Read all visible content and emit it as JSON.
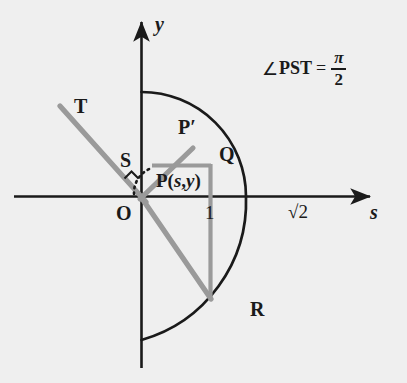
{
  "figure": {
    "kind": "geometry-diagram",
    "background_color": "#efefef",
    "ink_color": "#1a1a1a",
    "accent_color": "#9a9a9a",
    "annotation": {
      "angle_symbol": "∠",
      "angle_name": "PST",
      "equals": "=",
      "value_numerator": "π",
      "value_denominator": "2",
      "full_text": "∠PST = π/2"
    },
    "axes": {
      "y_axis_label": "y",
      "x_axis_label": "s",
      "origin_label": "O"
    },
    "ticks": [
      {
        "label": "1",
        "axis": "s",
        "value": 1
      },
      {
        "label": "√2",
        "axis": "s",
        "value": 1.414
      }
    ],
    "points": [
      {
        "name": "O",
        "label": "O",
        "x": 141,
        "y": 196
      },
      {
        "name": "P",
        "label": "P(s,y)",
        "label_main": "P(",
        "label_var1": "s",
        "label_comma": ",",
        "label_var2": "y",
        "label_close": ")",
        "x": 141,
        "y": 196
      },
      {
        "name": "P-prime",
        "label": "P′",
        "x": 188,
        "y": 136
      },
      {
        "name": "Q",
        "label": "Q",
        "x": 212,
        "y": 155
      },
      {
        "name": "R",
        "label": "R",
        "x": 243,
        "y": 300
      },
      {
        "name": "S",
        "label": "S",
        "x": 128,
        "y": 160
      },
      {
        "name": "T",
        "label": "T",
        "x": 82,
        "y": 108
      }
    ],
    "arc": {
      "description": "circular arc of radius √2 centered at origin",
      "radius_label": "√2"
    }
  }
}
